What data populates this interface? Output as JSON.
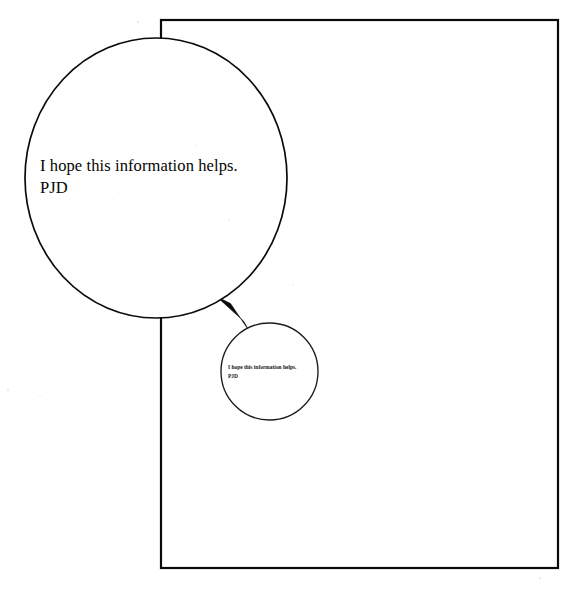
{
  "document": {
    "type": "scanned-page-with-magnified-callout",
    "background_color": "#ffffff",
    "ink_color": "#000000"
  },
  "page_outline": {
    "name": "page-border-rectangle",
    "x": 161,
    "y": 20,
    "width": 397,
    "height": 548,
    "stroke_color": "#000000",
    "stroke_width": 2
  },
  "callout_large": {
    "label": "magnified-callout-circle",
    "cx": 156,
    "cy": 178,
    "rx": 131,
    "ry": 140,
    "stroke_color": "#000000",
    "stroke_width": 1.6,
    "text_line_1": "I hope this information helps.",
    "text_line_2": "PJD",
    "text": "I hope this information helps.\nPJD"
  },
  "source_small": {
    "label": "source-region-circle",
    "cx": 269.5,
    "cy": 371.5,
    "rx": 48.5,
    "ry": 48.5,
    "stroke_color": "#000000",
    "stroke_width": 1.3,
    "text_line_1": "I hope this information helps.",
    "text_line_2": "PJD",
    "text": "I hope this information helps.\nPJD"
  },
  "connector": {
    "label": "magnifier-connector-wedge",
    "fill_color": "#000000",
    "from_x": 219,
    "from_y": 299,
    "tip_x": 248,
    "tip_y": 330
  },
  "signature": {
    "initials": "PJD"
  }
}
